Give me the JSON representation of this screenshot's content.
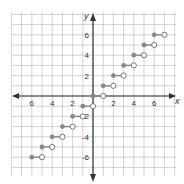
{
  "chart_data": {
    "type": "scatter",
    "title": "",
    "subtitle": "Step function (greatest integer), y = floor(x)",
    "xlabel": "x",
    "ylabel": "y",
    "xlim": [
      -8,
      8
    ],
    "ylim": [
      -8,
      8
    ],
    "grid": true,
    "legend": null,
    "x_tick_labels": [
      {
        "value": -6,
        "text": "6"
      },
      {
        "value": -4,
        "text": "4"
      },
      {
        "value": -2,
        "text": "2"
      },
      {
        "value": 2,
        "text": "2"
      },
      {
        "value": 4,
        "text": "4"
      },
      {
        "value": 6,
        "text": "6"
      }
    ],
    "y_tick_labels": [
      {
        "value": 6,
        "text": "6"
      },
      {
        "value": 4,
        "text": "4"
      },
      {
        "value": 2,
        "text": "2"
      },
      {
        "value": -2,
        "text": "-2"
      },
      {
        "value": -4,
        "text": "-4"
      },
      {
        "value": -6,
        "text": "-6"
      }
    ],
    "series": [
      {
        "name": "steps",
        "segments": [
          {
            "x_start": -6,
            "x_end": -5,
            "y": -6,
            "closed_start": true,
            "open_end": true
          },
          {
            "x_start": -5,
            "x_end": -4,
            "y": -5,
            "closed_start": true,
            "open_end": true
          },
          {
            "x_start": -4,
            "x_end": -3,
            "y": -4,
            "closed_start": true,
            "open_end": true
          },
          {
            "x_start": -3,
            "x_end": -2,
            "y": -3,
            "closed_start": true,
            "open_end": true
          },
          {
            "x_start": -2,
            "x_end": -1,
            "y": -2,
            "closed_start": true,
            "open_end": true
          },
          {
            "x_start": -1,
            "x_end": 0,
            "y": -1,
            "closed_start": true,
            "open_end": true
          },
          {
            "x_start": 0,
            "x_end": 1,
            "y": 0,
            "closed_start": true,
            "open_end": true
          },
          {
            "x_start": 1,
            "x_end": 2,
            "y": 1,
            "closed_start": true,
            "open_end": true
          },
          {
            "x_start": 2,
            "x_end": 3,
            "y": 2,
            "closed_start": true,
            "open_end": true
          },
          {
            "x_start": 3,
            "x_end": 4,
            "y": 3,
            "closed_start": true,
            "open_end": true
          },
          {
            "x_start": 4,
            "x_end": 5,
            "y": 4,
            "closed_start": true,
            "open_end": true
          },
          {
            "x_start": 5,
            "x_end": 6,
            "y": 5,
            "closed_start": true,
            "open_end": true
          },
          {
            "x_start": 6,
            "x_end": 7,
            "y": 6,
            "closed_start": true,
            "open_end": true
          }
        ]
      }
    ]
  },
  "colors": {
    "grid": "#c8c8c8",
    "axis": "#333333",
    "filled_dot": "#888888",
    "open_dot_stroke": "#777777",
    "segment": "#888888"
  },
  "layout": {
    "origin_px": [
      93,
      96
    ],
    "unit_px": 10.2,
    "grid_px": [
      12,
      12,
      176,
      176
    ]
  }
}
